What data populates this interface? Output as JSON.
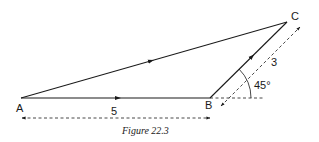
{
  "figure": {
    "caption": "Figure 22.3",
    "points": {
      "A": {
        "label": "A",
        "x": 21,
        "y": 98
      },
      "B": {
        "label": "B",
        "x": 210,
        "y": 98
      },
      "C": {
        "label": "C",
        "x": 287,
        "y": 22
      }
    },
    "vectors": [
      {
        "from": "A",
        "to": "B",
        "style": "solid",
        "arrow": "midpoint"
      },
      {
        "from": "B",
        "to": "C",
        "style": "solid",
        "arrow": "midpoint"
      },
      {
        "from": "A",
        "to": "C",
        "style": "solid",
        "arrow": "midpoint"
      }
    ],
    "dimensions": {
      "ab_length_label": "5",
      "bc_length_label": "3",
      "angle_label": "45°"
    }
  },
  "colors": {
    "line": "#1a1a1a",
    "background": "#ffffff"
  }
}
